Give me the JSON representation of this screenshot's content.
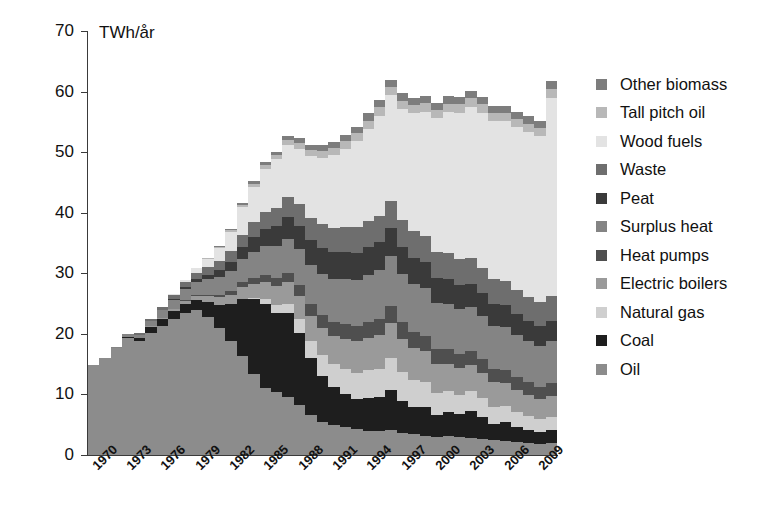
{
  "chart_data": {
    "type": "bar",
    "subtype": "stacked-column",
    "title": "",
    "xlabel": "",
    "ylabel": "TWh/år",
    "unit_label": "TWh/år",
    "ylim": [
      0,
      70
    ],
    "ytick_labels": [
      "70",
      "60",
      "50",
      "40",
      "30",
      "20",
      "10",
      "0"
    ],
    "ytick_values": [
      70,
      60,
      50,
      40,
      30,
      20,
      10,
      0
    ],
    "grid": false,
    "legend_position": "right",
    "x": [
      1970,
      1971,
      1972,
      1973,
      1974,
      1975,
      1976,
      1977,
      1978,
      1979,
      1980,
      1981,
      1982,
      1983,
      1984,
      1985,
      1986,
      1987,
      1988,
      1989,
      1990,
      1991,
      1992,
      1993,
      1994,
      1995,
      1996,
      1997,
      1998,
      1999,
      2000,
      2001,
      2002,
      2003,
      2004,
      2005,
      2006,
      2007,
      2008,
      2009,
      2010
    ],
    "xtick_labels": [
      "1970",
      "1973",
      "1976",
      "1979",
      "1982",
      "1985",
      "1988",
      "1991",
      "1994",
      "1997",
      "2000",
      "2003",
      "2006",
      "2009"
    ],
    "xtick_values": [
      1970,
      1973,
      1976,
      1979,
      1982,
      1985,
      1988,
      1991,
      1994,
      1997,
      2000,
      2003,
      2006,
      2009
    ],
    "series": [
      {
        "name": "Oil",
        "color": "#8c8c8c",
        "values": [
          14.8,
          16.0,
          17.6,
          19.3,
          18.8,
          20.2,
          21.3,
          22.4,
          23.5,
          24.0,
          22.8,
          20.9,
          18.9,
          16.3,
          13.4,
          11.0,
          10.4,
          9.6,
          8.2,
          6.6,
          5.5,
          5.0,
          4.6,
          4.3,
          4.0,
          3.9,
          4.2,
          3.7,
          3.4,
          3.2,
          3.0,
          3.1,
          2.9,
          2.8,
          2.6,
          2.4,
          2.3,
          2.1,
          2.0,
          1.9,
          2.0
        ]
      },
      {
        "name": "Coal",
        "color": "#1e1e1e",
        "values": [
          0.0,
          0.0,
          0.0,
          0.2,
          0.5,
          0.9,
          1.1,
          1.3,
          1.5,
          1.6,
          2.4,
          3.9,
          6.0,
          9.5,
          12.3,
          13.9,
          13.1,
          13.8,
          12.0,
          9.4,
          7.6,
          6.2,
          5.4,
          5.0,
          5.4,
          5.6,
          6.6,
          5.2,
          4.6,
          4.7,
          3.6,
          4.0,
          3.8,
          4.4,
          3.7,
          2.8,
          3.2,
          2.6,
          2.2,
          1.9,
          2.1
        ]
      },
      {
        "name": "Natural gas",
        "color": "#cfcfcf",
        "values": [
          0.0,
          0.0,
          0.0,
          0.0,
          0.0,
          0.0,
          0.0,
          0.0,
          0.0,
          0.0,
          0.0,
          0.0,
          0.0,
          0.0,
          0.3,
          0.8,
          1.2,
          1.6,
          2.2,
          2.9,
          3.4,
          3.8,
          4.2,
          4.3,
          4.6,
          4.7,
          5.2,
          4.8,
          4.4,
          4.1,
          3.6,
          3.4,
          3.2,
          3.3,
          3.1,
          2.8,
          2.6,
          2.4,
          2.2,
          2.1,
          2.2
        ]
      },
      {
        "name": "Electric boilers",
        "color": "#9a9a9a",
        "values": [
          0.0,
          0.0,
          0.0,
          0.0,
          0.0,
          0.2,
          0.3,
          0.4,
          0.5,
          0.7,
          1.0,
          1.3,
          1.6,
          2.0,
          2.3,
          2.8,
          3.2,
          3.5,
          3.8,
          4.1,
          4.4,
          4.7,
          5.0,
          5.2,
          5.4,
          5.6,
          5.8,
          5.5,
          5.3,
          5.1,
          4.8,
          4.6,
          4.4,
          4.3,
          4.1,
          4.0,
          3.8,
          3.7,
          3.5,
          3.4,
          3.5
        ]
      },
      {
        "name": "Heat pumps",
        "color": "#4f4f4f",
        "values": [
          0.0,
          0.0,
          0.0,
          0.0,
          0.0,
          0.0,
          0.0,
          0.0,
          0.1,
          0.2,
          0.3,
          0.4,
          0.6,
          0.8,
          1.0,
          1.2,
          1.4,
          1.6,
          1.8,
          2.0,
          2.2,
          2.3,
          2.4,
          2.5,
          2.6,
          2.7,
          2.8,
          2.7,
          2.6,
          2.6,
          2.5,
          2.4,
          2.4,
          2.3,
          2.3,
          2.2,
          2.2,
          2.1,
          2.1,
          2.0,
          2.1
        ]
      },
      {
        "name": "Surplus heat",
        "color": "#848484",
        "values": [
          0.0,
          0.0,
          0.2,
          0.4,
          0.6,
          0.9,
          1.2,
          1.5,
          1.8,
          2.1,
          2.5,
          2.9,
          3.3,
          3.8,
          4.3,
          4.8,
          5.2,
          5.6,
          6.0,
          6.4,
          6.8,
          7.1,
          7.4,
          7.6,
          7.8,
          8.0,
          8.2,
          8.0,
          7.9,
          7.8,
          7.6,
          7.5,
          7.4,
          7.3,
          7.2,
          7.1,
          7.0,
          6.9,
          6.8,
          6.7,
          6.9
        ]
      },
      {
        "name": "Peat",
        "color": "#3a3a3a",
        "values": [
          0.0,
          0.0,
          0.0,
          0.0,
          0.0,
          0.0,
          0.1,
          0.2,
          0.3,
          0.5,
          0.8,
          1.1,
          1.5,
          1.9,
          2.4,
          2.9,
          3.3,
          3.6,
          3.9,
          4.1,
          4.3,
          4.4,
          4.5,
          4.5,
          4.6,
          4.6,
          4.7,
          4.5,
          4.4,
          4.3,
          4.2,
          4.1,
          4.0,
          3.9,
          3.8,
          3.7,
          3.6,
          3.5,
          3.4,
          3.3,
          3.4
        ]
      },
      {
        "name": "Waste",
        "color": "#6e6e6e",
        "values": [
          0.0,
          0.0,
          0.0,
          0.1,
          0.2,
          0.3,
          0.4,
          0.6,
          0.8,
          1.0,
          1.2,
          1.5,
          1.8,
          2.1,
          2.4,
          2.7,
          3.0,
          3.3,
          3.5,
          3.7,
          3.9,
          4.0,
          4.1,
          4.2,
          4.3,
          4.4,
          4.5,
          4.4,
          4.4,
          4.3,
          4.3,
          4.2,
          4.2,
          4.2,
          4.1,
          4.1,
          4.0,
          4.0,
          3.9,
          3.9,
          4.0
        ]
      },
      {
        "name": "Wood fuels",
        "color": "#e3e3e3",
        "values": [
          0.0,
          0.0,
          0.0,
          0.0,
          0.0,
          0.0,
          0.1,
          0.2,
          0.4,
          0.8,
          1.4,
          2.2,
          3.2,
          4.5,
          5.9,
          7.2,
          8.0,
          8.6,
          9.2,
          10.1,
          11.0,
          12.0,
          13.0,
          14.2,
          15.2,
          16.5,
          17.4,
          18.3,
          19.4,
          20.6,
          22.0,
          23.3,
          24.2,
          25.0,
          25.6,
          26.0,
          26.4,
          26.8,
          27.2,
          27.4,
          32.8
        ]
      },
      {
        "name": "Tall pitch oil",
        "color": "#b8b8b8",
        "values": [
          0.0,
          0.0,
          0.0,
          0.0,
          0.0,
          0.0,
          0.0,
          0.0,
          0.0,
          0.0,
          0.1,
          0.2,
          0.3,
          0.4,
          0.5,
          0.6,
          0.7,
          0.8,
          0.9,
          1.0,
          1.1,
          1.2,
          1.2,
          1.3,
          1.3,
          1.4,
          1.4,
          1.4,
          1.4,
          1.4,
          1.4,
          1.4,
          1.4,
          1.4,
          1.4,
          1.4,
          1.4,
          1.4,
          1.4,
          1.4,
          1.4
        ]
      },
      {
        "name": "Other biomass",
        "color": "#7d7d7d",
        "values": [
          0.0,
          0.0,
          0.0,
          0.0,
          0.0,
          0.0,
          0.0,
          0.0,
          0.0,
          0.0,
          0.0,
          0.1,
          0.2,
          0.3,
          0.4,
          0.5,
          0.6,
          0.7,
          0.8,
          0.9,
          1.0,
          1.0,
          1.1,
          1.1,
          1.2,
          1.2,
          1.2,
          1.2,
          1.2,
          1.2,
          1.2,
          1.2,
          1.2,
          1.2,
          1.2,
          1.2,
          1.2,
          1.2,
          1.2,
          1.2,
          1.3
        ]
      }
    ],
    "legend": [
      {
        "label": "Other biomass",
        "color": "#7d7d7d"
      },
      {
        "label": "Tall pitch oil",
        "color": "#b8b8b8"
      },
      {
        "label": "Wood fuels",
        "color": "#e3e3e3"
      },
      {
        "label": "Waste",
        "color": "#6e6e6e"
      },
      {
        "label": "Peat",
        "color": "#3a3a3a"
      },
      {
        "label": "Surplus heat",
        "color": "#848484"
      },
      {
        "label": "Heat pumps",
        "color": "#4f4f4f"
      },
      {
        "label": "Electric boilers",
        "color": "#9a9a9a"
      },
      {
        "label": "Natural gas",
        "color": "#cfcfcf"
      },
      {
        "label": "Coal",
        "color": "#1e1e1e"
      },
      {
        "label": "Oil",
        "color": "#8c8c8c"
      }
    ]
  }
}
